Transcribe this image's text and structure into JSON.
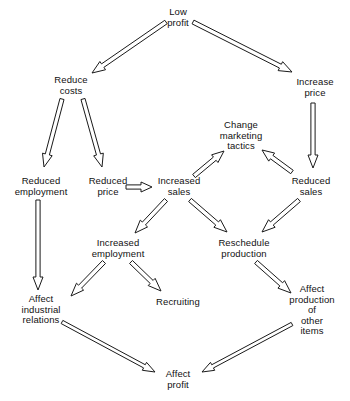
{
  "diagram": {
    "background_color": "#ffffff",
    "line_color": "#1a1a1a",
    "text_color": "#111111",
    "nodes": [
      {
        "id": "low-profit",
        "label": "Low\nprofit",
        "x": 178,
        "y": 17
      },
      {
        "id": "reduce-costs",
        "label": "Reduce\ncosts",
        "x": 71,
        "y": 85
      },
      {
        "id": "increase-price",
        "label": "Increase\nprice",
        "x": 315,
        "y": 87
      },
      {
        "id": "change-marketing",
        "label": "Change\nmarketing\ntactics",
        "x": 241,
        "y": 136
      },
      {
        "id": "reduced-employment",
        "label": "Reduced\nemployment",
        "x": 41,
        "y": 186
      },
      {
        "id": "reduced-price",
        "label": "Reduced\nprice",
        "x": 108,
        "y": 186
      },
      {
        "id": "increased-sales",
        "label": "Increased\nsales",
        "x": 179,
        "y": 186
      },
      {
        "id": "reduced-sales",
        "label": "Reduced\nsales",
        "x": 311,
        "y": 186
      },
      {
        "id": "increased-employment",
        "label": "Increased\nemployment",
        "x": 118,
        "y": 248
      },
      {
        "id": "reschedule-production",
        "label": "Reschedule\nproduction",
        "x": 244,
        "y": 248
      },
      {
        "id": "affect-industrial-relations",
        "label": "Affect\nindustrial\nrelations",
        "x": 41,
        "y": 310
      },
      {
        "id": "recruiting",
        "label": "Recruiting",
        "x": 178,
        "y": 302
      },
      {
        "id": "affect-production-other",
        "label": "Affect\nproduction of\nother items",
        "x": 312,
        "y": 310
      },
      {
        "id": "affect-profit",
        "label": "Affect\nprofit",
        "x": 178,
        "y": 379
      }
    ],
    "edges": [
      {
        "id": "low-profit-to-reduce-costs",
        "from": "low-profit",
        "to": "reduce-costs"
      },
      {
        "id": "low-profit-to-increase-price",
        "from": "low-profit",
        "to": "increase-price"
      },
      {
        "id": "reduce-costs-to-reduced-employment",
        "from": "reduce-costs",
        "to": "reduced-employment"
      },
      {
        "id": "reduce-costs-to-reduced-price",
        "from": "reduce-costs",
        "to": "reduced-price"
      },
      {
        "id": "increase-price-to-reduced-sales",
        "from": "increase-price",
        "to": "reduced-sales"
      },
      {
        "id": "reduced-price-to-increased-sales",
        "from": "reduced-price",
        "to": "increased-sales"
      },
      {
        "id": "increased-sales-to-change-marketing",
        "from": "increased-sales",
        "to": "change-marketing"
      },
      {
        "id": "reduced-sales-to-change-marketing",
        "from": "reduced-sales",
        "to": "change-marketing"
      },
      {
        "id": "reduced-employment-to-affect-industrial-relations",
        "from": "reduced-employment",
        "to": "affect-industrial-relations"
      },
      {
        "id": "increased-sales-to-increased-employment",
        "from": "increased-sales",
        "to": "increased-employment"
      },
      {
        "id": "increased-sales-to-reschedule-production",
        "from": "increased-sales",
        "to": "reschedule-production"
      },
      {
        "id": "reduced-sales-to-reschedule-production",
        "from": "reduced-sales",
        "to": "reschedule-production"
      },
      {
        "id": "increased-employment-to-affect-industrial-relations",
        "from": "increased-employment",
        "to": "affect-industrial-relations"
      },
      {
        "id": "increased-employment-to-recruiting",
        "from": "increased-employment",
        "to": "recruiting"
      },
      {
        "id": "reschedule-production-to-affect-production-other",
        "from": "reschedule-production",
        "to": "affect-production-other"
      },
      {
        "id": "affect-industrial-relations-to-affect-profit",
        "from": "affect-industrial-relations",
        "to": "affect-profit"
      },
      {
        "id": "affect-production-other-to-affect-profit",
        "from": "affect-production-other",
        "to": "affect-profit"
      }
    ],
    "arrow_geometry": [
      {
        "id": "low-profit-to-reduce-costs",
        "x1": 166,
        "y1": 22,
        "x2": 92,
        "y2": 73,
        "w": 4.2,
        "head_w": 10,
        "head_l": 13
      },
      {
        "id": "low-profit-to-increase-price",
        "x1": 193,
        "y1": 22,
        "x2": 292,
        "y2": 72,
        "w": 4.2,
        "head_w": 10,
        "head_l": 13
      },
      {
        "id": "reduce-costs-to-reduced-employment",
        "x1": 62,
        "y1": 99,
        "x2": 44,
        "y2": 167,
        "w": 4.2,
        "head_w": 10,
        "head_l": 13
      },
      {
        "id": "reduce-costs-to-reduced-price",
        "x1": 83,
        "y1": 99,
        "x2": 102,
        "y2": 167,
        "w": 4.2,
        "head_w": 10,
        "head_l": 13
      },
      {
        "id": "increase-price-to-reduced-sales",
        "x1": 313,
        "y1": 103,
        "x2": 313,
        "y2": 168,
        "w": 4.2,
        "head_w": 10,
        "head_l": 13
      },
      {
        "id": "reduced-price-to-increased-sales",
        "x1": 126,
        "y1": 187,
        "x2": 152,
        "y2": 187,
        "w": 4.2,
        "head_w": 10,
        "head_l": 11
      },
      {
        "id": "increased-sales-to-change-marketing",
        "x1": 194,
        "y1": 176,
        "x2": 224,
        "y2": 151,
        "w": 4.2,
        "head_w": 10,
        "head_l": 12
      },
      {
        "id": "reduced-sales-to-change-marketing",
        "x1": 292,
        "y1": 172,
        "x2": 262,
        "y2": 150,
        "w": 4.2,
        "head_w": 10,
        "head_l": 12
      },
      {
        "id": "reduced-employment-to-affect-industrial-relations",
        "x1": 38,
        "y1": 200,
        "x2": 38,
        "y2": 290,
        "w": 4.2,
        "head_w": 10,
        "head_l": 13
      },
      {
        "id": "increased-sales-to-increased-employment",
        "x1": 166,
        "y1": 200,
        "x2": 135,
        "y2": 233,
        "w": 4.2,
        "head_w": 10,
        "head_l": 13
      },
      {
        "id": "increased-sales-to-reschedule-production",
        "x1": 190,
        "y1": 200,
        "x2": 227,
        "y2": 232,
        "w": 4.2,
        "head_w": 10,
        "head_l": 13
      },
      {
        "id": "reduced-sales-to-reschedule-production",
        "x1": 299,
        "y1": 200,
        "x2": 262,
        "y2": 232,
        "w": 4.2,
        "head_w": 10,
        "head_l": 13
      },
      {
        "id": "increased-employment-to-affect-industrial-relations",
        "x1": 104,
        "y1": 262,
        "x2": 71,
        "y2": 296,
        "w": 4.2,
        "head_w": 10,
        "head_l": 13
      },
      {
        "id": "increased-employment-to-recruiting",
        "x1": 131,
        "y1": 262,
        "x2": 161,
        "y2": 291,
        "w": 4.2,
        "head_w": 10,
        "head_l": 13
      },
      {
        "id": "reschedule-production-to-affect-production-other",
        "x1": 256,
        "y1": 262,
        "x2": 291,
        "y2": 293,
        "w": 4.2,
        "head_w": 10,
        "head_l": 13
      },
      {
        "id": "affect-industrial-relations-to-affect-profit",
        "x1": 62,
        "y1": 322,
        "x2": 155,
        "y2": 372,
        "w": 3.6,
        "head_w": 9,
        "head_l": 12
      },
      {
        "id": "affect-production-other-to-affect-profit",
        "x1": 292,
        "y1": 324,
        "x2": 202,
        "y2": 372,
        "w": 3.6,
        "head_w": 9,
        "head_l": 12
      }
    ]
  }
}
